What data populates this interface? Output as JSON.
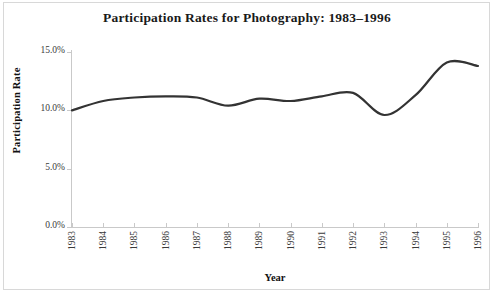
{
  "chart_data": {
    "type": "line",
    "title": "Participation Rates for Photography: 1983–1996",
    "xlabel": "Year",
    "ylabel": "Participation Rate",
    "categories": [
      "1983",
      "1984",
      "1985",
      "1986",
      "1987",
      "1988",
      "1989",
      "1990",
      "1991",
      "1992",
      "1993",
      "1994",
      "1995",
      "1996"
    ],
    "x": [
      1983,
      1984,
      1985,
      1986,
      1987,
      1988,
      1989,
      1990,
      1991,
      1992,
      1993,
      1994,
      1995,
      1996
    ],
    "values": [
      10.0,
      10.8,
      11.1,
      11.2,
      11.1,
      10.4,
      11.0,
      10.8,
      11.2,
      11.5,
      9.6,
      11.3,
      14.1,
      13.8
    ],
    "series": [
      {
        "name": "Participation Rate",
        "values": [
          10.0,
          10.8,
          11.1,
          11.2,
          11.1,
          10.4,
          11.0,
          10.8,
          11.2,
          11.5,
          9.6,
          11.3,
          14.1,
          13.8
        ]
      }
    ],
    "ylim": [
      0.0,
      15.0
    ],
    "ytick_labels": [
      "0.0%",
      "5.0%",
      "10.0%",
      "15.0%"
    ],
    "ytick_values": [
      0.0,
      5.0,
      10.0,
      15.0
    ],
    "xtick_labels": [
      "1983",
      "1984",
      "1985",
      "1986",
      "1987",
      "1988",
      "1989",
      "1990",
      "1991",
      "1992",
      "1993",
      "1994",
      "1995",
      "1996"
    ],
    "grid": false,
    "legend": "none",
    "line_color": "#333333",
    "axis_color": "#c9c9c9",
    "background_color": "#ffffff",
    "smoothing": "spline"
  }
}
